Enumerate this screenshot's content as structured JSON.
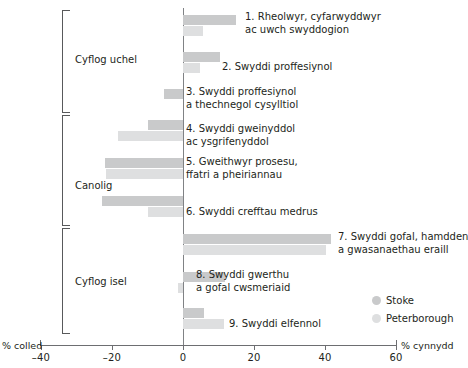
{
  "chart_data": {
    "type": "bar",
    "orientation": "horizontal",
    "title": "",
    "xlabel_left": "% colled",
    "xlabel_right": "% cynnydd",
    "ylabel": "",
    "xlim": [
      -40,
      60
    ],
    "grid": false,
    "legend_position": "right-bottom",
    "xticks": [
      -40,
      -20,
      0,
      20,
      40,
      60
    ],
    "xtick_labels": [
      "–40",
      "–20",
      "0",
      "20",
      "40",
      "60"
    ],
    "categories": [
      "1. Rheolwyr, cyfarwyddwyr ac uwch swyddogion",
      "2. Swyddi proffesiynol",
      "3. Swyddi proffesiynol a thechnegol cysylltiol",
      "4. Swyddi gweinyddol ac ysgrifenyddol",
      "5. Gweithwyr prosesu, ffatri a pheiriannau",
      "6. Swyddi crefftau medrus",
      "7. Swyddi gofal, hamdden a gwasanaethau eraill",
      "8. Swyddi gwerthu a gofal cwsmeriaid",
      "9. Swyddi elfennol"
    ],
    "series": [
      {
        "name": "Stoke",
        "color": "#c9cacb",
        "values": [
          15.0,
          10.4,
          -5.3,
          -9.8,
          -22.0,
          -22.7,
          41.7,
          11.8,
          5.9
        ]
      },
      {
        "name": "Peterborough",
        "color": "#dedfe0",
        "values": [
          5.6,
          4.8,
          0.0,
          -18.2,
          -21.6,
          -10.0,
          40.3,
          -1.5,
          11.5
        ]
      }
    ]
  },
  "bar_labels": [
    {
      "line1": "1. Rheolwyr, cyfarwyddwyr",
      "line2": "ac uwch swyddogion"
    },
    {
      "line1": "2. Swyddi proffesiynol",
      "line2": ""
    },
    {
      "line1": "3. Swyddi proffesiynol",
      "line2": "a thechnegol cysylltiol"
    },
    {
      "line1": "4. Swyddi gweinyddol",
      "line2": "ac ysgrifenyddol"
    },
    {
      "line1": "5. Gweithwyr prosesu,",
      "line2": "ffatri a pheiriannau"
    },
    {
      "line1": "6. Swyddi crefftau medrus",
      "line2": ""
    },
    {
      "line1": "7. Swyddi gofal, hamdden",
      "line2": "a gwasanaethau eraill"
    },
    {
      "line1": "8. Swyddi gwerthu",
      "line2": "a gofal cwsmeriaid"
    },
    {
      "line1": "9. Swyddi elfennol",
      "line2": ""
    }
  ],
  "groups": [
    {
      "label": "Cyflog uchel"
    },
    {
      "label": "Canolig"
    },
    {
      "label": "Cyflog isel"
    }
  ],
  "legend": {
    "items": [
      {
        "label": "Stoke",
        "color": "#c9cacb"
      },
      {
        "label": "Peterborough",
        "color": "#dedfe0"
      }
    ]
  },
  "axis": {
    "left_caption": "% colled",
    "right_caption": "% cynnydd",
    "ticks": [
      {
        "label": "–40",
        "value": -40
      },
      {
        "label": "–20",
        "value": -20
      },
      {
        "label": "0",
        "value": 0
      },
      {
        "label": "20",
        "value": 20
      },
      {
        "label": "40",
        "value": 40
      },
      {
        "label": "60",
        "value": 60
      }
    ]
  }
}
